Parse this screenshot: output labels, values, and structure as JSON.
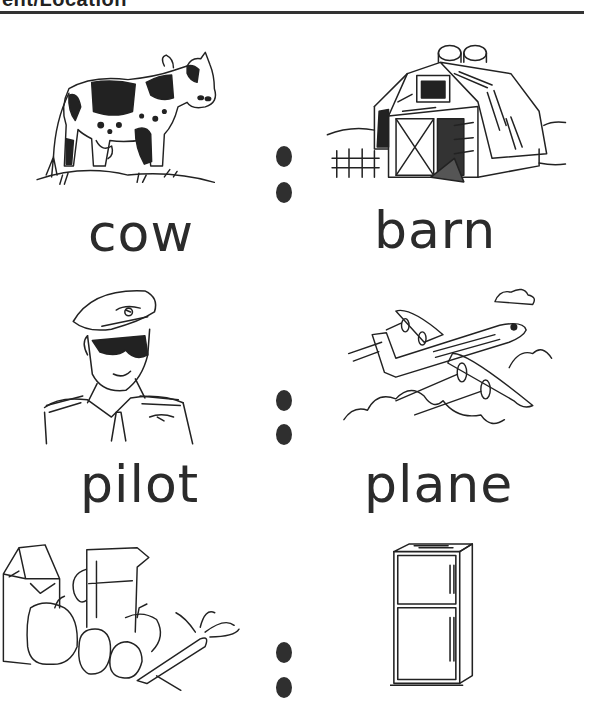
{
  "header": {
    "title_partial": "ent/Location"
  },
  "worksheet": {
    "rows": [
      {
        "left": {
          "word": "cow",
          "image": "cow-illustration"
        },
        "right": {
          "word": "barn",
          "image": "barn-illustration"
        }
      },
      {
        "left": {
          "word": "pilot",
          "image": "pilot-illustration"
        },
        "right": {
          "word": "plane",
          "image": "plane-illustration"
        }
      },
      {
        "left": {
          "word": "",
          "image": "food-groceries-illustration"
        },
        "right": {
          "word": "",
          "image": "refrigerator-illustration"
        }
      }
    ],
    "separator": "colon-dots"
  },
  "colors": {
    "ink": "#2b2b2b",
    "background": "#ffffff"
  }
}
